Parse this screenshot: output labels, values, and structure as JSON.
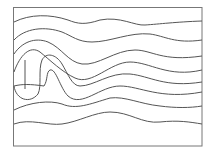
{
  "diagram": {
    "type": "streamlines",
    "frame": {
      "x": 13.5,
      "y": 7.5,
      "width": 188.5,
      "height": 138.5,
      "stroke": "#777777"
    },
    "line_color": "#555555",
    "streamlines": [
      {
        "name": "streamline-1",
        "d": "M14,22 C30,14 50,14 68,20 C78,24 85,25 100,20 C120,16 135,26 145,25 C160,24 175,22 202,21"
      },
      {
        "name": "streamline-2",
        "d": "M14,40 C25,28 45,26 62,32 C72,36 78,42 92,42 C110,42 130,32 150,34 C165,36 175,44 202,40"
      },
      {
        "name": "streamline-3",
        "d": "M14,54 C22,42 35,37 48,42 C62,48 68,62 82,64 C98,66 115,50 135,50 C152,50 162,62 202,56"
      },
      {
        "name": "streamline-4",
        "d": "M14,72 C20,55 30,45 40,52 C50,60 62,72 75,78 C92,86 110,62 130,62 C150,62 168,78 202,70"
      },
      {
        "name": "streamline-5",
        "d": "M25,60 L25,89"
      },
      {
        "name": "streamline-6",
        "d": "M14,86 C16,100 30,104 38,94 C42,86 38,70 42,60 C46,52 56,54 62,64 C68,74 72,86 80,86 C94,86 110,72 130,74 C150,76 165,88 202,82"
      },
      {
        "name": "streamline-7",
        "d": "M14,86 C22,84 30,84 44,86 C48,80 46,72 50,70 C56,68 60,88 68,96 C82,108 100,86 120,86 C140,86 160,100 202,92"
      },
      {
        "name": "streamline-8",
        "d": "M14,110 C30,102 50,100 62,104 C76,110 90,104 110,98 C125,96 140,104 160,106 C175,108 190,108 202,106"
      },
      {
        "name": "streamline-9",
        "d": "M14,124 C30,118 48,126 62,124 C78,122 95,112 110,112 C130,112 142,124 160,122 C178,120 190,122 202,124"
      }
    ]
  }
}
